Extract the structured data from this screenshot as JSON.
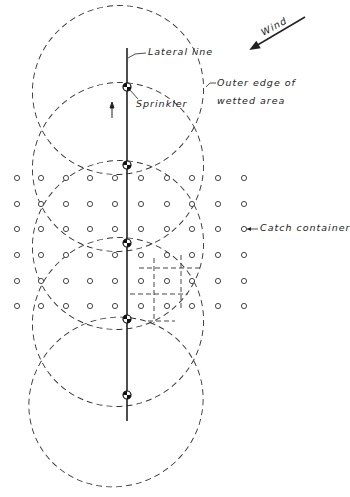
{
  "labels": {
    "wind": "Wind",
    "lateral_line": "Lateral line",
    "outer_edge_line1": "Outer edge of",
    "outer_edge_line2": "wetted area",
    "sprinkler": "Sprinkler",
    "catch_container": "Catch container"
  },
  "colors": {
    "ink": "#222222",
    "background": "#ffffff"
  },
  "lateral_line": {
    "x": 127,
    "y_top": 48,
    "y_bottom": 421
  },
  "sprinklers": [
    {
      "x": 127,
      "y": 87
    },
    {
      "x": 127,
      "y": 165
    },
    {
      "x": 127,
      "y": 243
    },
    {
      "x": 127,
      "y": 319
    },
    {
      "x": 127,
      "y": 395
    }
  ],
  "wetted_areas": [
    {
      "cx": 118,
      "cy": 90,
      "rx": 86,
      "ry": 84,
      "rotate": -28
    },
    {
      "cx": 118,
      "cy": 167,
      "rx": 86,
      "ry": 84,
      "rotate": -28
    },
    {
      "cx": 118,
      "cy": 245,
      "rx": 86,
      "ry": 84,
      "rotate": -28
    },
    {
      "cx": 118,
      "cy": 322,
      "rx": 86,
      "ry": 84,
      "rotate": -28
    },
    {
      "cx": 116,
      "cy": 402,
      "rx": 88,
      "ry": 84,
      "rotate": -28
    }
  ],
  "catch_grid": {
    "columns_x": [
      17,
      41,
      66,
      90,
      115,
      141,
      167,
      192,
      218,
      244
    ],
    "rows_y": [
      178,
      204,
      229,
      255,
      281,
      306
    ],
    "radius": 2.6
  },
  "sample_area_dashes": [
    {
      "x1": 139,
      "y1": 268,
      "x2": 200,
      "y2": 268
    },
    {
      "x1": 130,
      "y1": 294,
      "x2": 188,
      "y2": 294
    },
    {
      "x1": 154,
      "y1": 258,
      "x2": 154,
      "y2": 323
    },
    {
      "x1": 181,
      "y1": 255,
      "x2": 181,
      "y2": 308
    },
    {
      "x1": 148,
      "y1": 321,
      "x2": 175,
      "y2": 321
    }
  ],
  "wind_arrow": {
    "x1": 305,
    "y1": 17,
    "x2": 251,
    "y2": 49
  },
  "travel_arrow": {
    "x": 112,
    "y1": 118,
    "y2": 102
  }
}
